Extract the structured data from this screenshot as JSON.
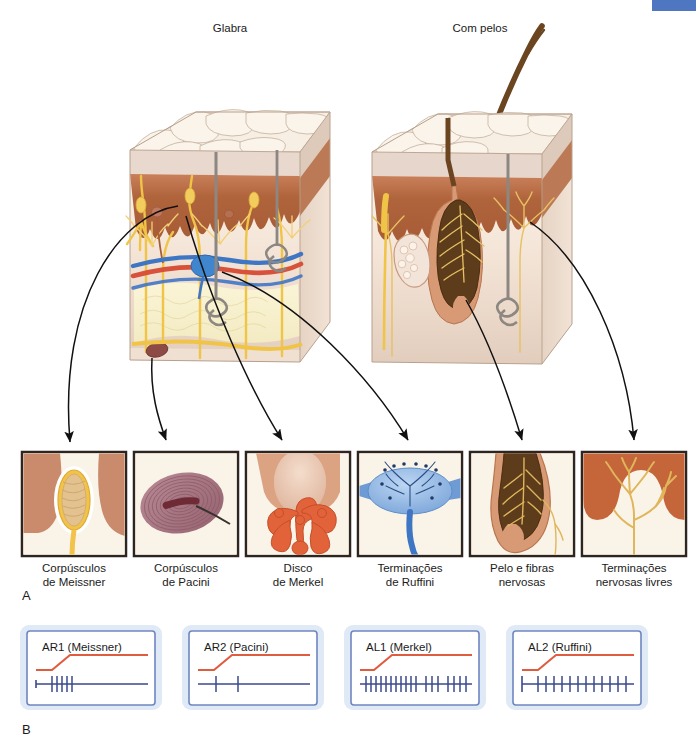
{
  "figure": {
    "title_top_left": "Glabra",
    "title_top_right": "Com pelos",
    "panel_a_letter": "A",
    "panel_b_letter": "B",
    "language": "pt-BR",
    "colors": {
      "epidermis_surface": "#f6ece0",
      "epidermis_ridge_line": "#b9a391",
      "stratum_pale": "#e8d8cd",
      "dermis_brown": "#b0643c",
      "dermis_light": "#e8d6c4",
      "hypodermis_fat": "#f7f0ce",
      "nerve_yellow": "#f3c84a",
      "artery_red": "#d8513a",
      "vein_blue": "#3f76c4",
      "hair_brown": "#6b4420",
      "hair_shaft_gray": "#8d8782",
      "pacini_mauve": "#a6707f",
      "pacini_core": "#6e2b35",
      "merkel_orange": "#e2623a",
      "ruffini_blue": "#7fa9dd",
      "ruffini_stem": "#3f76c4",
      "free_ending_gold": "#e0b65c",
      "arrow_black": "#111111",
      "inset_border": "#2e2520",
      "inset_bg": "#faf3e8",
      "trace_stimulus": "#e05c3e",
      "trace_spike": "#3a4a8c",
      "b_box_border": "#6f86c0",
      "b_box_glow": "#dbe6f5",
      "corner_accent": "#4f76c0"
    }
  },
  "panel_a": {
    "blocks": [
      {
        "name": "glabrous-skin-block",
        "label": "Glabra"
      },
      {
        "name": "hairy-skin-block",
        "label": "Com pelos"
      }
    ],
    "insets": [
      {
        "id": "meissner",
        "line1": "Corpúsculos",
        "line2": "de Meissner"
      },
      {
        "id": "pacini",
        "line1": "Corpúsculos",
        "line2": "de Pacini"
      },
      {
        "id": "merkel",
        "line1": "Disco",
        "line2": "de Merkel"
      },
      {
        "id": "ruffini",
        "line1": "Terminações",
        "line2": "de Ruffini"
      },
      {
        "id": "hair-follicle",
        "line1": "Pelo e fibras",
        "line2": "nervosas"
      },
      {
        "id": "free-endings",
        "line1": "Terminações",
        "line2": "nervosas livres"
      }
    ]
  },
  "panel_b": {
    "traces": [
      {
        "id": "ar1",
        "label": "AR1 (Meissner)",
        "adaptation": "rapidly-adapting",
        "spike_count": 5,
        "spike_pattern": "onset-burst"
      },
      {
        "id": "ar2",
        "label": "AR2 (Pacini)",
        "adaptation": "rapidly-adapting",
        "spike_count": 2,
        "spike_pattern": "sparse-onset"
      },
      {
        "id": "al1",
        "label": "AL1 (Merkel)",
        "adaptation": "slowly-adapting",
        "spike_count": 19,
        "spike_pattern": "sustained-dense"
      },
      {
        "id": "al2",
        "label": "AL2 (Ruffini)",
        "adaptation": "slowly-adapting",
        "spike_count": 13,
        "spike_pattern": "sustained-regular"
      }
    ]
  }
}
